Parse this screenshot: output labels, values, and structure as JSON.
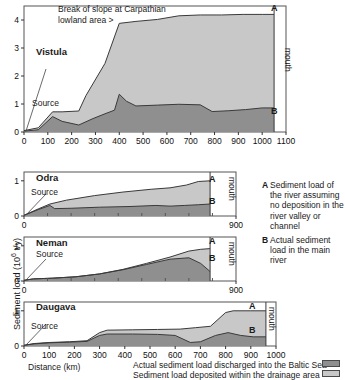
{
  "figure": {
    "ylabel": "Sediment load (106 t/y)",
    "xlabel": "Distance (km)",
    "annotation_line1": "Break of slope at Carpathian",
    "annotation_line2": "lowland area  >",
    "source_label": "Source",
    "mouth_label": "mouth",
    "series_a_key": "A",
    "series_b_key": "B"
  },
  "legend_right": [
    {
      "key": "A",
      "text": "Sediment load of the river assuming no deposition in the river valley or channel"
    },
    {
      "key": "B",
      "text": "Actual sediment load in the main river"
    }
  ],
  "legend_bottom": [
    {
      "text": "Actual sediment load discharged into the Baltic Sea",
      "color": "#8f8f8f"
    },
    {
      "text": "Sediment load deposited within the drainage area",
      "color": "#c8c8c8"
    }
  ],
  "colors": {
    "deposited_fill": "#c8c8c8",
    "discharged_fill": "#8f8f8f",
    "line": "#3a3a3a",
    "axis": "#555555"
  },
  "chart_data": [
    {
      "type": "area",
      "title": "Vistula",
      "xlabel": "Distance (km)",
      "ylabel": "Sediment load (106 t/y)",
      "xlim": [
        0,
        1100
      ],
      "ylim": [
        0,
        4.5
      ],
      "xticks": [
        0,
        100,
        200,
        300,
        400,
        500,
        600,
        700,
        800,
        900,
        1000,
        1100
      ],
      "yticks": [
        0,
        1,
        2,
        3,
        4
      ],
      "mouth_x": 1050,
      "grid": false,
      "series": [
        {
          "name": "A",
          "x": [
            0,
            60,
            120,
            160,
            230,
            260,
            340,
            400,
            470,
            560,
            650,
            740,
            830,
            920,
            1000,
            1050
          ],
          "values": [
            0.05,
            0.15,
            0.72,
            0.72,
            0.75,
            1.3,
            2.45,
            3.88,
            3.95,
            4.02,
            4.15,
            4.18,
            4.18,
            4.2,
            4.2,
            4.2
          ]
        },
        {
          "name": "B",
          "x": [
            0,
            60,
            120,
            160,
            230,
            290,
            340,
            380,
            400,
            430,
            470,
            560,
            650,
            740,
            790,
            860,
            930,
            1000,
            1050
          ],
          "values": [
            0.03,
            0.08,
            0.55,
            0.38,
            0.25,
            0.48,
            0.65,
            0.78,
            1.35,
            1.1,
            0.93,
            0.96,
            0.99,
            0.97,
            0.73,
            0.76,
            0.8,
            0.86,
            0.86
          ]
        }
      ]
    },
    {
      "type": "area",
      "title": "Odra",
      "xlim": [
        0,
        900
      ],
      "ylim": [
        0,
        1.25
      ],
      "xticks": [
        0,
        900
      ],
      "yticks": [
        0,
        1
      ],
      "mouth_x": 790,
      "grid": false,
      "series": [
        {
          "name": "A",
          "x": [
            0,
            60,
            110,
            180,
            300,
            420,
            540,
            620,
            690,
            740,
            790
          ],
          "values": [
            0.02,
            0.2,
            0.34,
            0.45,
            0.58,
            0.68,
            0.76,
            0.8,
            0.88,
            0.98,
            1.0
          ]
        },
        {
          "name": "B",
          "x": [
            0,
            60,
            110,
            130,
            200,
            320,
            450,
            560,
            620,
            680,
            740,
            790
          ],
          "values": [
            0.02,
            0.18,
            0.3,
            0.21,
            0.22,
            0.25,
            0.27,
            0.3,
            0.28,
            0.3,
            0.32,
            0.34
          ]
        }
      ]
    },
    {
      "type": "area",
      "title": "Neman",
      "xlim": [
        0,
        900
      ],
      "ylim": [
        0,
        1.25
      ],
      "xticks": [
        0,
        900
      ],
      "yticks": [
        0,
        1
      ],
      "mouth_x": 790,
      "grid": false,
      "series": [
        {
          "name": "A",
          "x": [
            0,
            40,
            120,
            220,
            320,
            420,
            520,
            620,
            700,
            750,
            790
          ],
          "values": [
            0.02,
            0.06,
            0.08,
            0.12,
            0.2,
            0.33,
            0.5,
            0.68,
            0.85,
            0.9,
            0.92
          ]
        },
        {
          "name": "B",
          "x": [
            0,
            40,
            120,
            220,
            320,
            420,
            520,
            620,
            700,
            750,
            790
          ],
          "values": [
            0.02,
            0.06,
            0.08,
            0.12,
            0.2,
            0.32,
            0.47,
            0.62,
            0.66,
            0.5,
            0.27
          ]
        }
      ]
    },
    {
      "type": "area",
      "title": "Daugava",
      "xlim": [
        0,
        1000
      ],
      "ylim": [
        0,
        1.25
      ],
      "xticks": [
        0,
        100,
        200,
        300,
        400,
        500,
        600,
        700,
        800,
        900,
        1000
      ],
      "yticks": [
        0,
        1
      ],
      "mouth_x": 960,
      "grid": false,
      "series": [
        {
          "name": "A",
          "x": [
            0,
            40,
            100,
            180,
            250,
            300,
            330,
            430,
            530,
            620,
            680,
            740,
            800,
            830,
            900,
            960
          ],
          "values": [
            0.02,
            0.07,
            0.1,
            0.12,
            0.15,
            0.38,
            0.45,
            0.46,
            0.47,
            0.48,
            0.52,
            0.56,
            0.95,
            1.0,
            1.0,
            1.0
          ]
        },
        {
          "name": "B",
          "x": [
            0,
            40,
            100,
            180,
            250,
            300,
            330,
            430,
            530,
            600,
            660,
            700,
            760,
            810,
            860,
            910,
            960
          ],
          "values": [
            0.02,
            0.06,
            0.09,
            0.11,
            0.13,
            0.3,
            0.34,
            0.34,
            0.33,
            0.3,
            0.1,
            0.12,
            0.3,
            0.38,
            0.3,
            0.26,
            0.26
          ]
        }
      ]
    }
  ]
}
